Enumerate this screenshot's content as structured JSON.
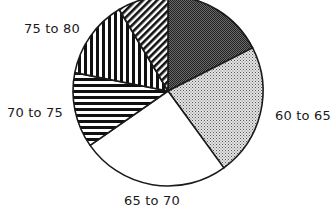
{
  "chart_data": {
    "type": "pie",
    "title": "",
    "start_angle_deg": 0,
    "direction": "clockwise",
    "legend": "none (labels placed beside slices)",
    "slices": [
      {
        "label": "55 to 60",
        "value": 17.5,
        "pattern": "dense-dark-dots",
        "label_clipped": true
      },
      {
        "label": "60 to 65",
        "value": 22.5,
        "pattern": "light-dots"
      },
      {
        "label": "65 to 70",
        "value": 25.3,
        "pattern": "none"
      },
      {
        "label": "70 to 75",
        "value": 12.8,
        "pattern": "horizontal-lines"
      },
      {
        "label": "75 to 80",
        "value": 13.3,
        "pattern": "vertical-lines"
      },
      {
        "label": "",
        "value": 8.6,
        "pattern": "diagonal-lines"
      }
    ],
    "units": "percent (estimated from slice angles)"
  },
  "labels": {
    "s0": "55 to 60",
    "s1": "60 to 65",
    "s2": "65 to 70",
    "s3": "70 to 75",
    "s4": "75 to 80"
  },
  "geometry": {
    "cx": 168,
    "cy": 91,
    "r": 95
  },
  "colors": {
    "stroke": "#1a1a1a",
    "background": "#ffffff"
  }
}
